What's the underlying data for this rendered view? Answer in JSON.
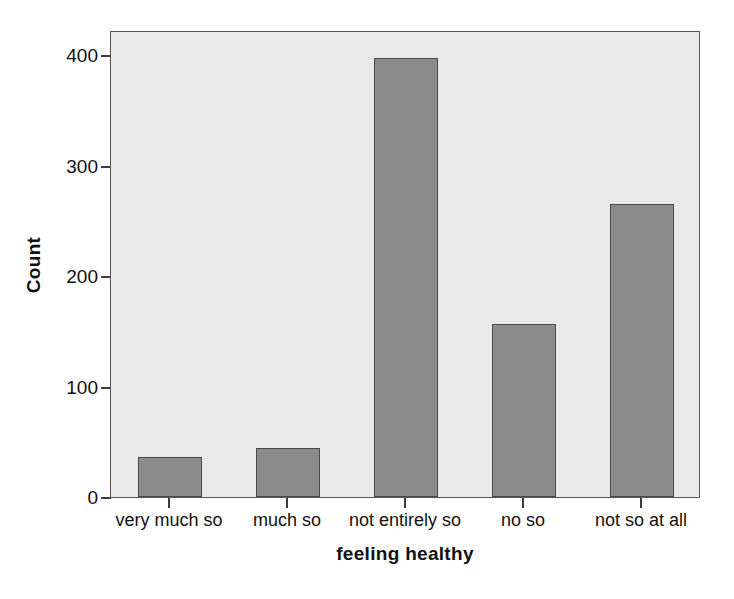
{
  "chart_data": {
    "type": "bar",
    "title": "",
    "subtitle": "",
    "xlabel": "feeling healthy",
    "ylabel": "Count",
    "categories": [
      "very much so",
      "much so",
      "not entirely so",
      "no so",
      "not so at all"
    ],
    "values": [
      36,
      44,
      398,
      157,
      265
    ],
    "series": [
      {
        "name": "Count",
        "values": [
          36,
          44,
          398,
          157,
          265
        ]
      }
    ],
    "ylim": [
      0,
      423
    ],
    "yticks": [
      0,
      100,
      200,
      300,
      400
    ],
    "ytick_labels": [
      "0",
      "100",
      "200",
      "300",
      "400"
    ],
    "grid": false,
    "legend": false,
    "legend_position": "none",
    "annotations": [],
    "colors": {
      "bar_fill": "#8b8b8b",
      "bar_edge": "#4a4a4a",
      "plot_background": "#e9e9e9",
      "figure_background": "#ffffff",
      "axis": "#555555",
      "text": "#111111"
    }
  },
  "axes": {
    "y_axis_label": "Count",
    "x_axis_label": "feeling healthy"
  }
}
